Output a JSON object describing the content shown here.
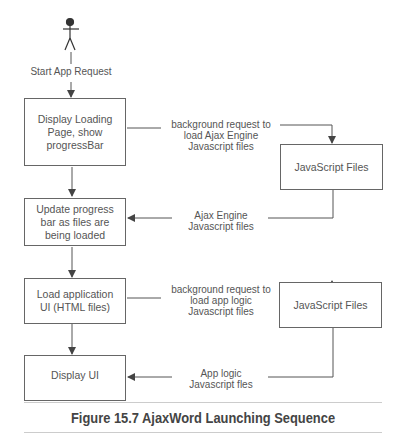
{
  "figure": {
    "caption": "Figure 15.7 AjaxWord Launching Sequence"
  },
  "actor": {
    "label": "Start App Request"
  },
  "steps": [
    {
      "lines": [
        "Display Loading",
        "Page, show",
        "progressBar"
      ]
    },
    {
      "lines": [
        "Update progress",
        "bar as files are",
        "being loaded"
      ]
    },
    {
      "lines": [
        "Load application",
        "UI (HTML files)"
      ]
    },
    {
      "lines": [
        "Display UI"
      ]
    }
  ],
  "resources": [
    {
      "label": "JavaScript Files"
    },
    {
      "label": "JavaScript Files"
    }
  ],
  "messages": [
    {
      "lines": [
        "background request to",
        "load Ajax Engine",
        "Javascript files"
      ]
    },
    {
      "lines": [
        "Ajax Engine",
        "Javascript files"
      ]
    },
    {
      "lines": [
        "background request to",
        "load app logic",
        "Javascript files"
      ]
    },
    {
      "lines": [
        "App logic",
        "Javascript fles"
      ]
    }
  ],
  "colors": {
    "line": "#555555",
    "border": "#666666",
    "text": "#555555",
    "rule": "#cccccc"
  }
}
